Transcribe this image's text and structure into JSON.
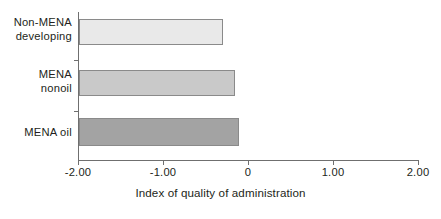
{
  "chart_data": {
    "type": "bar",
    "orientation": "horizontal",
    "title": "",
    "xlabel": "Index of quality of administration",
    "ylabel": "",
    "categories": [
      "Non-MENA developing",
      "MENA nonoil",
      "MENA oil"
    ],
    "values": [
      -0.31,
      -0.17,
      -0.12
    ],
    "series": [
      {
        "name": "Index of quality of administration",
        "values": [
          -0.31,
          -0.17,
          -0.12
        ]
      }
    ],
    "xlim": [
      -2.0,
      2.0
    ],
    "xticks": [
      -2.0,
      -1.0,
      0,
      1.0,
      2.0
    ],
    "xtick_labels": [
      "-2.00",
      "-1.00",
      "0",
      "1.00",
      "2.00"
    ],
    "grid": false,
    "legend": false,
    "bar_colors": [
      "#e9e9e9",
      "#c9c9c9",
      "#a3a3a3"
    ],
    "bar_border_color": "#8a8a8a",
    "axis_color": "#6f6f6f",
    "text_color": "#231f20",
    "bars": [
      {
        "category": "Non-MENA developing",
        "label_lines": "Non-MENA\ndeveloping",
        "value": -0.31,
        "color": "#e9e9e9"
      },
      {
        "category": "MENA nonoil",
        "label_lines": "MENA\nnonoil",
        "value": -0.17,
        "color": "#c9c9c9"
      },
      {
        "category": "MENA oil",
        "label_lines": "MENA oil",
        "value": -0.12,
        "color": "#a3a3a3"
      }
    ]
  }
}
